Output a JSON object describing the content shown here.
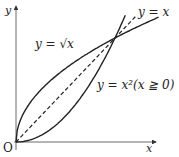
{
  "axes": {
    "x_label": "x",
    "y_label": "y",
    "origin_label": "O"
  },
  "curves": [
    {
      "name": "sqrt",
      "label": "y = √x",
      "style": "solid"
    },
    {
      "name": "identity",
      "label": "y = x",
      "style": "dashed"
    },
    {
      "name": "square",
      "label": "y = x²(x ≧ 0)",
      "style": "solid"
    }
  ],
  "labels": {
    "sqrt": "y = √x",
    "identity": "y = x",
    "square": "y = x²(x ≧ 0)"
  },
  "intersection": {
    "x": 1,
    "y": 1
  }
}
